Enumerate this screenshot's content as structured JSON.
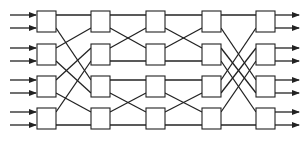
{
  "diagram": {
    "title": "",
    "type": "multistage switching network",
    "colors": {
      "stroke": "#222222",
      "box_fill": "#ffffff",
      "background": "#ffffff"
    },
    "columns": [
      37,
      91,
      146,
      202,
      256
    ],
    "rows": [
      11,
      44,
      76,
      108
    ],
    "box": {
      "w": 19,
      "h": 21
    },
    "ports": {
      "top": 4,
      "bottom": 17
    },
    "inputs": 8,
    "outputs": 8,
    "stages": [
      [
        [
          0,
          0,
          0,
          0
        ],
        [
          0,
          1,
          2,
          0
        ],
        [
          1,
          0,
          0,
          1
        ],
        [
          1,
          1,
          2,
          1
        ],
        [
          2,
          0,
          1,
          0
        ],
        [
          2,
          1,
          3,
          0
        ],
        [
          3,
          0,
          1,
          1
        ],
        [
          3,
          1,
          3,
          1
        ]
      ],
      [
        [
          0,
          0,
          0,
          0
        ],
        [
          0,
          1,
          1,
          0
        ],
        [
          1,
          0,
          0,
          1
        ],
        [
          1,
          1,
          1,
          1
        ],
        [
          2,
          0,
          2,
          0
        ],
        [
          2,
          1,
          3,
          0
        ],
        [
          3,
          0,
          2,
          1
        ],
        [
          3,
          1,
          3,
          1
        ]
      ],
      [
        [
          0,
          0,
          0,
          0
        ],
        [
          0,
          1,
          1,
          0
        ],
        [
          1,
          0,
          0,
          1
        ],
        [
          1,
          1,
          1,
          1
        ],
        [
          2,
          0,
          2,
          0
        ],
        [
          2,
          1,
          3,
          0
        ],
        [
          3,
          0,
          2,
          1
        ],
        [
          3,
          1,
          3,
          1
        ]
      ],
      [
        [
          0,
          0,
          0,
          0
        ],
        [
          0,
          1,
          2,
          0
        ],
        [
          1,
          0,
          2,
          1
        ],
        [
          1,
          1,
          3,
          0
        ],
        [
          2,
          0,
          0,
          1
        ],
        [
          2,
          1,
          1,
          0
        ],
        [
          3,
          0,
          1,
          1
        ],
        [
          3,
          1,
          3,
          1
        ]
      ]
    ]
  }
}
